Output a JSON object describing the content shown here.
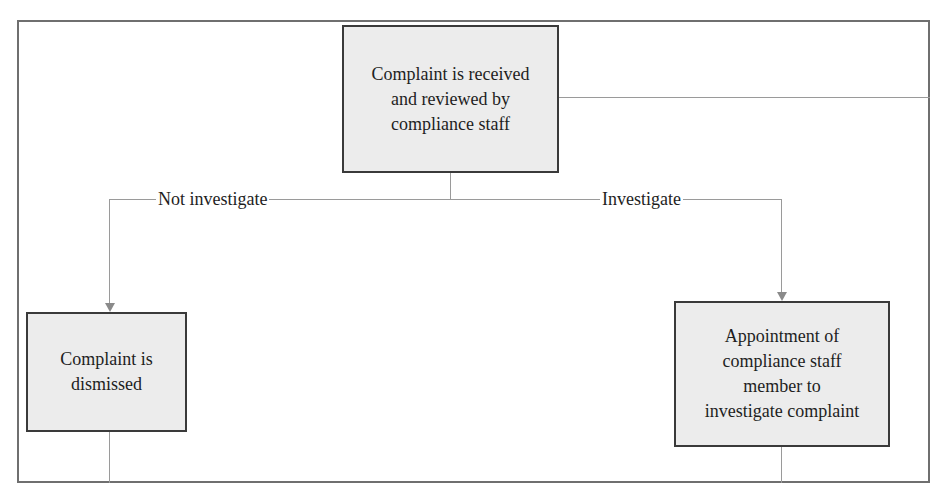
{
  "diagram": {
    "type": "flowchart",
    "nodes": {
      "received": {
        "label": "Complaint is received and reviewed by compliance staff",
        "lines": [
          "Complaint is received",
          "and reviewed by",
          "compliance staff"
        ]
      },
      "dismissed": {
        "label": "Complaint is dismissed",
        "lines": [
          "Complaint is",
          "dismissed"
        ]
      },
      "appointment": {
        "label": "Appointment of compliance staff member to investigate complaint",
        "lines": [
          "Appointment of",
          "compliance staff",
          "member to",
          "investigate complaint"
        ]
      }
    },
    "edges": [
      {
        "from": "received",
        "to": "dismissed",
        "label": "Not investigate"
      },
      {
        "from": "received",
        "to": "appointment",
        "label": "Investigate"
      }
    ],
    "edge_labels": {
      "not_investigate": "Not investigate",
      "investigate": "Investigate"
    },
    "colors": {
      "node_fill": "#ececec",
      "node_border": "#3a3a3a",
      "connector": "#9a9a9a",
      "frame": "#6f6f6f"
    }
  }
}
